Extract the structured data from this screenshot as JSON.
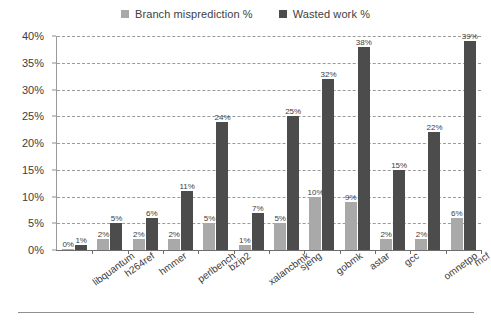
{
  "legend": {
    "position": "top-center",
    "entries": [
      {
        "label": "Branch misprediction %",
        "color": "#a9a9a9",
        "icon": "square-marker"
      },
      {
        "label": "Wasted work %",
        "color": "#4c4c4c",
        "icon": "square-marker"
      }
    ]
  },
  "axis": {
    "y_ticks": [
      "0%",
      "5%",
      "10%",
      "15%",
      "20%",
      "25%",
      "30%",
      "35%",
      "40%"
    ]
  },
  "chart_data": {
    "type": "bar",
    "title": "",
    "xlabel": "",
    "ylabel": "",
    "ylim": [
      0,
      40
    ],
    "ytick_step": 5,
    "grid": true,
    "legend_position": "top-center",
    "categories": [
      "libquantum",
      "h264ref",
      "hmmer",
      "perlbench",
      "bzip2",
      "xalancbmk",
      "sjeng",
      "gobmk",
      "astar",
      "gcc",
      "omnetpp",
      "mcf"
    ],
    "series": [
      {
        "name": "Branch misprediction %",
        "color": "#a9a9a9",
        "values": [
          0,
          2,
          2,
          2,
          5,
          1,
          5,
          10,
          9,
          2,
          2,
          6
        ],
        "labels": [
          "0%",
          "2%",
          "2%",
          "2%",
          "5%",
          "1%",
          "5%",
          "10%",
          "9%",
          "2%",
          "2%",
          "6%"
        ]
      },
      {
        "name": "Wasted work %",
        "color": "#4c4c4c",
        "values": [
          1,
          5,
          6,
          11,
          24,
          7,
          25,
          32,
          38,
          15,
          22,
          39
        ],
        "labels": [
          "1%",
          "5%",
          "6%",
          "11%",
          "24%",
          "7%",
          "25%",
          "32%",
          "38%",
          "15%",
          "22%",
          "39%"
        ]
      }
    ]
  }
}
